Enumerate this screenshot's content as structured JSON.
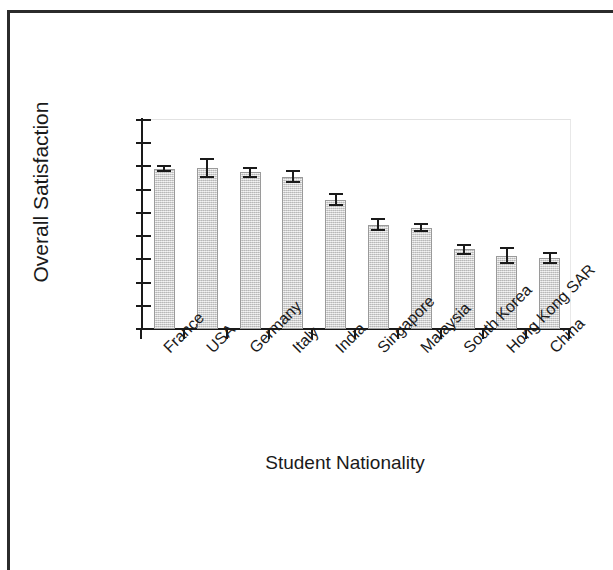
{
  "chart_data": {
    "type": "bar",
    "title": "",
    "xlabel": "Student Nationality",
    "ylabel": "Overall Satisfaction",
    "categories": [
      "France",
      "USA",
      "Germany",
      "Italy",
      "India",
      "Singapore",
      "Malaysia",
      "South Korea",
      "Hong Kong SAR",
      "China"
    ],
    "values": [
      3.245,
      3.247,
      3.237,
      3.228,
      3.178,
      3.125,
      3.118,
      3.072,
      3.058,
      3.053
    ],
    "errors": [
      0.008,
      0.022,
      0.012,
      0.014,
      0.014,
      0.014,
      0.01,
      0.012,
      0.018,
      0.013
    ],
    "series": [
      {
        "name": "Overall Satisfaction",
        "values": [
          3.245,
          3.247,
          3.237,
          3.228,
          3.178,
          3.125,
          3.118,
          3.072,
          3.058,
          3.053
        ]
      }
    ],
    "ylim": [
      2.9,
      3.35
    ],
    "ytick_labels": [
      "3.35",
      "3.3",
      "3.25",
      "3.2",
      "3.15",
      "3.1",
      "3.05",
      "3",
      "2.95",
      "2.9"
    ],
    "ytick_values": [
      3.35,
      3.3,
      3.25,
      3.2,
      3.15,
      3.1,
      3.05,
      3.0,
      2.95,
      2.9
    ],
    "grid": false,
    "legend": false,
    "legend_position": "none",
    "bar_fill_color": "#d7d7d7",
    "bar_edge_color": "#9a9a9a",
    "axis_color": "#1a1a1a",
    "error_bar_color": "#1a1a1a",
    "xlabel_rotation": -45
  }
}
